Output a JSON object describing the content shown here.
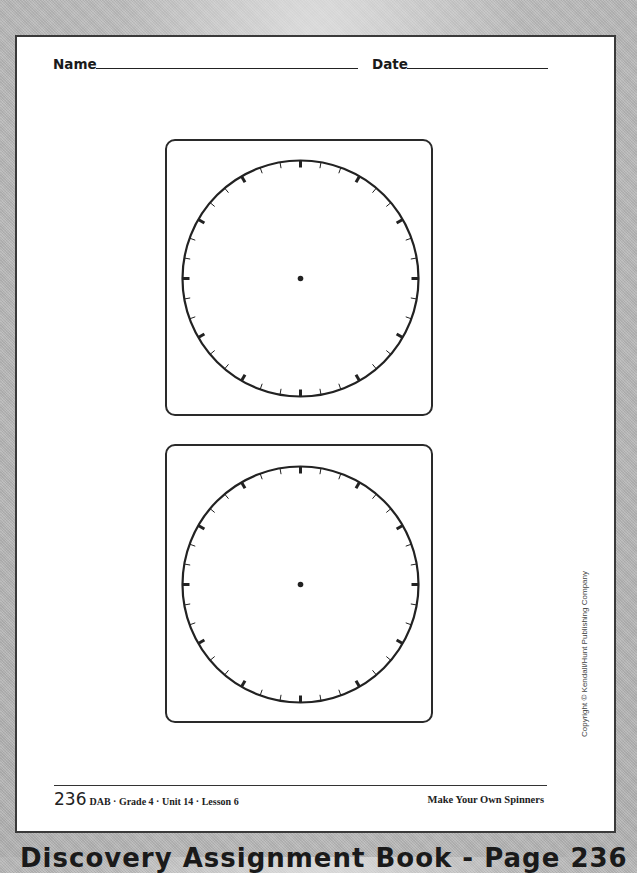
{
  "header": {
    "name_label": "Name",
    "date_label": "Date"
  },
  "spinners": [
    {
      "id": "spinner-1",
      "ticks": 36,
      "major_every": 3,
      "center_dot": true
    },
    {
      "id": "spinner-2",
      "ticks": 36,
      "major_every": 3,
      "center_dot": true
    }
  ],
  "footer": {
    "page_number": "236",
    "meta": "DAB · Grade 4 · Unit 14 · Lesson 6",
    "title": "Make Your Own Spinners"
  },
  "copyright": "Copyright © Kendall/Hunt Publishing Company",
  "caption": "Discovery Assignment Book - Page 236",
  "colors": {
    "ink": "#222222",
    "page": "#ffffff",
    "background": "#b9b9b9"
  }
}
